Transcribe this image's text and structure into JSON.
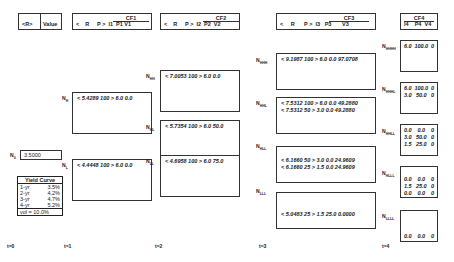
{
  "header": {
    "r_label": "<R>",
    "value_label": "Value",
    "cols": [
      {
        "cf": "CF1",
        "row": [
          "<",
          "R",
          "P",
          ">",
          "I1",
          "P1",
          "V1"
        ]
      },
      {
        "cf": "CF2",
        "row": [
          "<",
          "R",
          "P",
          ">",
          "I2",
          "P2",
          "V2"
        ]
      },
      {
        "cf": "CF3",
        "row": [
          "<",
          "R",
          "P",
          ">",
          "I3",
          "P3",
          "V3"
        ]
      },
      {
        "cf": "CF4",
        "row": [
          "I4",
          "P4",
          "V4"
        ]
      }
    ]
  },
  "root": {
    "label": "N0",
    "value": "3.5000"
  },
  "t1": [
    {
      "label": "NH",
      "lines": [
        "<  5.4289  100  >  6.0  0.0"
      ]
    },
    {
      "label": "NL",
      "lines": [
        "<  4.4448  100  >  6.0  0.0"
      ]
    }
  ],
  "t2": [
    {
      "label": "NHH",
      "lines": [
        "<  7.0053  100  >  6.0   0.0"
      ]
    },
    {
      "label": "NHL",
      "lines": [
        "<  5.7354  100  >  6.0   50.0"
      ]
    },
    {
      "label": "NLL",
      "lines": [
        "<  4.6958  100  >  6.0   75.0"
      ]
    }
  ],
  "t3": [
    {
      "label": "NHHH",
      "lines": [
        "<  9.1987  100  >  6.0   0.0  97.0708"
      ]
    },
    {
      "label": "NHHL",
      "lines": [
        "<  7.5312  100  >  6.0   0.0  49.2880",
        "<  7.5312   50  >  3.0   0.0  49.2880"
      ]
    },
    {
      "label": "NHLL",
      "lines": [
        "<  6.1660   50  >  3.0   0.0  24.9609",
        "<  6.1660   25  >  1.5   0.0  24.9609"
      ]
    },
    {
      "label": "NLLL",
      "lines": [
        "<  5.0483   25  >  1.5  25.0    0.0000"
      ]
    }
  ],
  "t4": [
    {
      "label": "NHHHH",
      "rows": [
        [
          "6.0",
          "100.0",
          "0"
        ]
      ]
    },
    {
      "label": "NHHHL",
      "rows": [
        [
          "6.0",
          "100.0",
          "0"
        ],
        [
          "3.0",
          "50.0",
          "0"
        ]
      ]
    },
    {
      "label": "NHHLL",
      "rows": [
        [
          "0.0",
          "0.0",
          "0"
        ],
        [
          "3.0",
          "50.0",
          "0"
        ],
        [
          "1.5",
          "25.0",
          "0"
        ]
      ]
    },
    {
      "label": "NHLLL",
      "rows": [
        [
          "0.0",
          "0.0",
          "0"
        ],
        [
          "1.5",
          "25.0",
          "0"
        ],
        [
          "0.0",
          "0.0",
          "0"
        ]
      ]
    },
    {
      "label": "NLLLL",
      "rows": [
        [
          "0.0",
          "0.0",
          "0"
        ]
      ]
    }
  ],
  "yield_curve": {
    "title": "Yield Curve",
    "rows": [
      [
        "1-yr",
        "3.5%"
      ],
      [
        "2-yr",
        "4.2%"
      ],
      [
        "3-yr",
        "4.7%"
      ],
      [
        "4-yr",
        "5.2%"
      ]
    ],
    "vol": "vol =  10.0%"
  },
  "time_labels": [
    "t=0",
    "t=1",
    "t=2",
    "t=3",
    "t=4"
  ]
}
